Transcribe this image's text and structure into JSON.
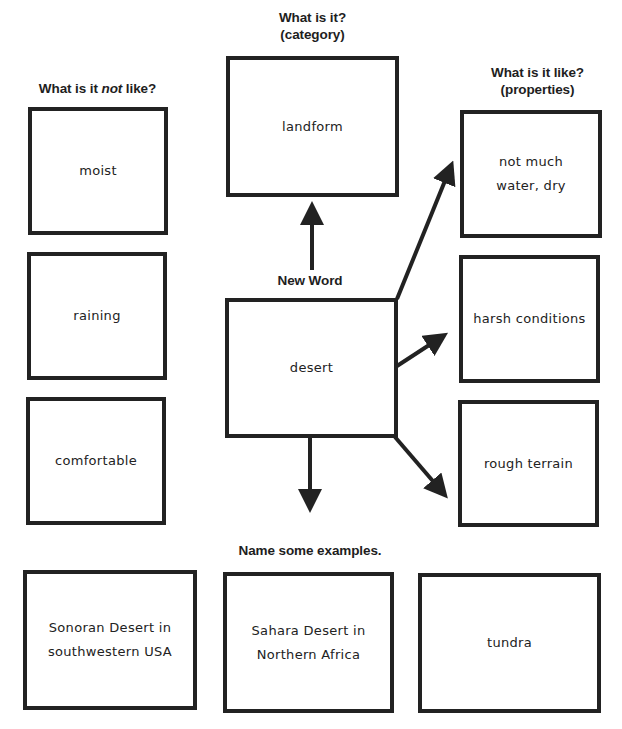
{
  "diagram": {
    "type": "word map / concept definition map",
    "headings": {
      "not_like": {
        "pre": "What is it ",
        "em": "not",
        "post": " like?"
      },
      "category": {
        "line1": "What is it?",
        "line2": "(category)"
      },
      "properties": {
        "line1": "What is it like?",
        "line2": "(properties)"
      },
      "new_word": "New Word",
      "examples": "Name some examples."
    },
    "new_word": "desert",
    "category": "landform",
    "not_like": [
      "moist",
      "raining",
      "comfortable"
    ],
    "properties": [
      "not much\nwater, dry",
      "harsh conditions",
      "rough terrain"
    ],
    "examples": [
      "Sonoran Desert in\nsouthwestern USA",
      "Sahara Desert in\nNorthern Africa",
      "tundra"
    ],
    "colors": {
      "border": "#222222",
      "text": "#222222",
      "background": "#ffffff"
    }
  }
}
